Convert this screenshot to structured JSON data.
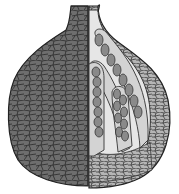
{
  "figure": {
    "colors": {
      "outer_wall": "#6e6e6e",
      "outer_wall_dark": "#4a4a4a",
      "cell_lines": "#2a2a2a",
      "interior": "#e4e4e4",
      "wall_section": "#b5b5b5",
      "ascus": "#d0d0d0",
      "ascospore": "#8a8a8a",
      "background": "#ffffff"
    },
    "asci_count": 4
  }
}
